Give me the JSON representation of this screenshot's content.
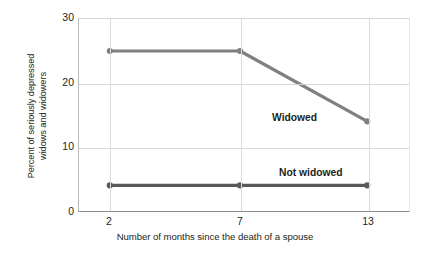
{
  "chart_data": {
    "type": "line",
    "title": "",
    "xlabel": "Number of months since the death of a spouse",
    "ylabel": "Percent of seriously depressed widows and widowers",
    "ylabel_line1": "Percent of seriously depressed",
    "ylabel_line2": "widows and widowers",
    "categories": [
      "2",
      "7",
      "13"
    ],
    "x": [
      2,
      7,
      13
    ],
    "series": [
      {
        "name": "Widowed",
        "values": [
          25,
          25,
          14
        ],
        "color": "#808080"
      },
      {
        "name": "Not widowed",
        "values": [
          4,
          4,
          4
        ],
        "color": "#595959"
      }
    ],
    "ylim": [
      0,
      30
    ],
    "yticks": [
      0,
      10,
      20,
      30
    ],
    "ytick_labels": [
      "0",
      "10",
      "20",
      "30"
    ],
    "xtick_labels": [
      "2",
      "7",
      "13"
    ],
    "grid": "horizontal-and-vertical",
    "legend": "inline-labels",
    "marker": "circle",
    "background": "#ffffff",
    "gridline_color": "#d6d6d6",
    "axis_color": "#8c8c8c"
  }
}
